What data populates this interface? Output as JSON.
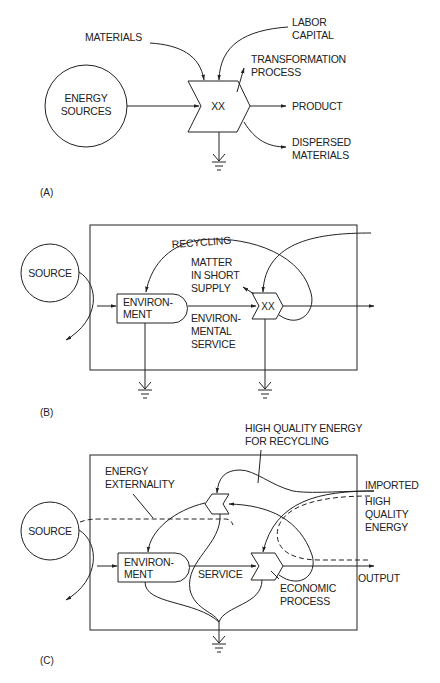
{
  "diagrams": [
    {
      "panel_label": "(A)",
      "nodes": {
        "source": [
          "ENERGY",
          "SOURCES"
        ],
        "process": "XX"
      },
      "labels": {
        "materials": "MATERIALS",
        "labor": [
          "LABOR",
          "CAPITAL"
        ],
        "transformation": [
          "TRANSFORMATION",
          "PROCESS"
        ],
        "product": "PRODUCT",
        "dispersed": [
          "DISPERSED",
          "MATERIALS"
        ]
      }
    },
    {
      "panel_label": "(B)",
      "nodes": {
        "source": "SOURCE",
        "environment": [
          "ENVIRON-",
          "MENT"
        ],
        "process": "XX"
      },
      "labels": {
        "recycling": "RECYCLING",
        "matter": [
          "MATTER",
          "IN SHORT",
          "SUPPLY"
        ],
        "service": [
          "ENVIRON-",
          "MENTAL",
          "SERVICE"
        ]
      }
    },
    {
      "panel_label": "(C)",
      "nodes": {
        "source": "SOURCE",
        "environment": [
          "ENVIRON-",
          "MENT"
        ]
      },
      "labels": {
        "hq_recycling": [
          "HIGH QUALITY ENERGY",
          "FOR RECYCLING"
        ],
        "externality": [
          "ENERGY",
          "EXTERNALITY"
        ],
        "imported": [
          "IMPORTED",
          "HIGH",
          "QUALITY",
          "ENERGY"
        ],
        "service": "SERVICE",
        "output": "OUTPUT",
        "economic": [
          "ECONOMIC",
          "PROCESS"
        ]
      }
    }
  ]
}
